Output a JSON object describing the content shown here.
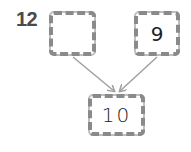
{
  "question": {
    "number": "12"
  },
  "boxes": {
    "left": {
      "value": ""
    },
    "right": {
      "value": "9"
    },
    "bottom": {
      "value": "10"
    }
  },
  "colors": {
    "box_border": "#8a8a8a",
    "arrow": "#a0a0a0",
    "number": "#4a4a4a"
  }
}
